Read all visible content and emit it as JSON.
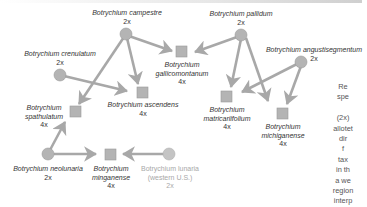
{
  "colors": {
    "node_fill": "#b4b4b4",
    "node_stroke": "#9a9a9a",
    "arrow": "#a8a8a8",
    "label": "#333333",
    "faded_label": "#a8a8a8"
  },
  "nodes": [
    {
      "id": "campestre",
      "shape": "circle",
      "name": "Botrychium campestre",
      "ploidy": "2x"
    },
    {
      "id": "pallidum",
      "shape": "circle",
      "name": "Botrychium pallidum",
      "ploidy": "2x"
    },
    {
      "id": "crenulatum",
      "shape": "circle",
      "name": "Botrychium crenulatum",
      "ploidy": "2x"
    },
    {
      "id": "angustisegmentum",
      "shape": "circle",
      "name": "Botrychium angustisegmentum",
      "ploidy": "2x"
    },
    {
      "id": "gallicomontanum",
      "shape": "square",
      "name_line1": "Botrychium",
      "name_line2": "gallicomontanum",
      "ploidy": "4x"
    },
    {
      "id": "ascendens",
      "shape": "square",
      "name": "Botrychium ascendens",
      "ploidy": "4x"
    },
    {
      "id": "spathulatum",
      "shape": "square",
      "name_line1": "Botrychium",
      "name_line2": "spathulatum",
      "ploidy": "4x"
    },
    {
      "id": "matricariifolium",
      "shape": "square",
      "name_line1": "Botrychium",
      "name_line2": "matricariifolium",
      "ploidy": "4x"
    },
    {
      "id": "michiganense",
      "shape": "square",
      "name_line1": "Botrychium",
      "name_line2": "michiganense",
      "ploidy": "4x"
    },
    {
      "id": "neolunaria",
      "shape": "circle",
      "name": "Botrychium neolunaria",
      "ploidy": "2x"
    },
    {
      "id": "minganense",
      "shape": "square",
      "name_line1": "Botrychium",
      "name_line2": "minganense",
      "ploidy": "4x"
    },
    {
      "id": "tunux",
      "shape": "circle",
      "faded": true,
      "name": "Botrychium lunaria",
      "region": "(western U.S.)",
      "ploidy": "2x"
    }
  ],
  "edges": [
    [
      "campestre",
      "gallicomontanum"
    ],
    [
      "campestre",
      "ascendens"
    ],
    [
      "campestre",
      "spathulatum"
    ],
    [
      "crenulatum",
      "ascendens"
    ],
    [
      "pallidum",
      "gallicomontanum"
    ],
    [
      "pallidum",
      "matricariifolium"
    ],
    [
      "pallidum",
      "michiganense"
    ],
    [
      "angustisegmentum",
      "matricariifolium"
    ],
    [
      "angustisegmentum",
      "michiganense"
    ],
    [
      "neolunaria",
      "spathulatum"
    ],
    [
      "neolunaria",
      "minganense"
    ],
    [
      "tunux",
      "minganense"
    ]
  ],
  "side_text": [
    "Re",
    "spe",
    "",
    "(2x)",
    "allotet",
    "dir",
    "f",
    "tax",
    "in th",
    "a we",
    "region",
    "interp"
  ]
}
